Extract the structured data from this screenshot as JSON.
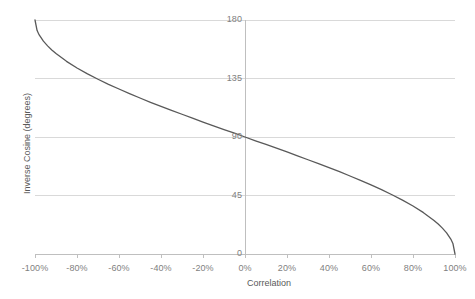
{
  "chart_data": {
    "type": "line",
    "title": "",
    "xlabel": "Correlation",
    "ylabel": "Inverse Cosine (degrees)",
    "xlim": [
      -100,
      100
    ],
    "ylim": [
      0,
      180
    ],
    "grid": true,
    "legend": null,
    "x_tick_labels": [
      "-100%",
      "-80%",
      "-60%",
      "-40%",
      "-20%",
      "0%",
      "20%",
      "40%",
      "60%",
      "80%",
      "100%"
    ],
    "x_tick_values": [
      -100,
      -80,
      -60,
      -40,
      -20,
      0,
      20,
      40,
      60,
      80,
      100
    ],
    "y_tick_labels": [
      "0",
      "45",
      "90",
      "135",
      "180"
    ],
    "y_tick_values": [
      0,
      45,
      90,
      135,
      180
    ],
    "series": [
      {
        "name": "Inverse Cosine",
        "color": "#595959",
        "x": [
          -100,
          -99,
          -98,
          -96,
          -94,
          -92,
          -90,
          -85,
          -80,
          -75,
          -70,
          -65,
          -60,
          -55,
          -50,
          -45,
          -40,
          -35,
          -30,
          -25,
          -20,
          -15,
          -10,
          -5,
          0,
          5,
          10,
          15,
          20,
          25,
          30,
          35,
          40,
          45,
          50,
          55,
          60,
          65,
          70,
          75,
          80,
          85,
          90,
          92,
          94,
          96,
          98,
          99,
          100
        ],
        "y": [
          180.0,
          171.9,
          168.5,
          163.7,
          160.1,
          156.9,
          154.2,
          148.2,
          143.1,
          138.6,
          134.4,
          130.5,
          126.9,
          123.4,
          120.0,
          116.7,
          113.6,
          110.5,
          107.5,
          104.5,
          101.5,
          98.6,
          95.7,
          92.9,
          90.0,
          87.1,
          84.3,
          81.4,
          78.5,
          75.5,
          72.5,
          69.5,
          66.4,
          63.3,
          60.0,
          56.6,
          53.1,
          49.5,
          45.6,
          41.4,
          36.9,
          31.8,
          25.8,
          23.1,
          19.9,
          16.3,
          11.5,
          8.1,
          0.0
        ]
      }
    ]
  },
  "style": {
    "grid_color": "#d9d9d9",
    "axis_color": "#bfbfbf",
    "tick_color": "#bfbfbf",
    "label_color": "#7f7f7f",
    "title_color": "#595959",
    "background": "#ffffff"
  }
}
